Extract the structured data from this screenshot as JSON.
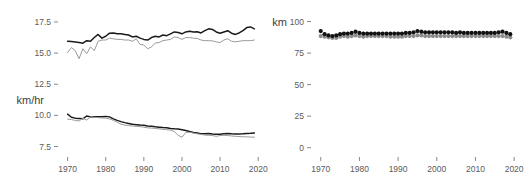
{
  "figure": {
    "background": "#ffffff",
    "text_color": "#4a4a4a"
  },
  "chart_data": [
    {
      "id": "speed-panel",
      "type": "line",
      "title": "",
      "xlabel": "",
      "ylabel": "km/hr",
      "ylabel_text": "km/hr",
      "xlim": [
        1968,
        2021
      ],
      "ylim": [
        6.9,
        18.3
      ],
      "yticks": [
        7.5,
        10.0,
        12.5,
        15.0,
        17.5
      ],
      "ytick_labels": [
        "7.5",
        "10.0",
        "12.5",
        "15.0",
        "17.5"
      ],
      "xticks": [
        1970,
        1980,
        1990,
        2000,
        2010,
        2020
      ],
      "xtick_labels": [
        "1970",
        "1980",
        "1990",
        "2000",
        "2010",
        "2020"
      ],
      "grid": false,
      "legend": "none",
      "x": [
        1970,
        1971,
        1972,
        1973,
        1974,
        1975,
        1976,
        1977,
        1978,
        1979,
        1980,
        1981,
        1982,
        1983,
        1984,
        1985,
        1986,
        1987,
        1988,
        1989,
        1990,
        1991,
        1992,
        1993,
        1994,
        1995,
        1996,
        1997,
        1998,
        1999,
        2000,
        2001,
        2002,
        2003,
        2004,
        2005,
        2006,
        2007,
        2008,
        2009,
        2010,
        2011,
        2012,
        2013,
        2014,
        2015,
        2016,
        2017,
        2018,
        2019
      ],
      "series": [
        {
          "name": "upper-black-speed",
          "color": "#1a1a1a",
          "width": 1.6,
          "values": [
            15.95,
            15.93,
            15.9,
            15.85,
            15.8,
            16.0,
            15.95,
            16.25,
            16.5,
            16.2,
            16.35,
            16.6,
            16.62,
            16.55,
            16.55,
            16.5,
            16.45,
            16.3,
            16.35,
            16.2,
            16.1,
            16.05,
            16.25,
            16.35,
            16.3,
            16.45,
            16.4,
            16.55,
            16.7,
            16.65,
            16.55,
            16.7,
            16.75,
            16.7,
            16.72,
            16.62,
            16.8,
            16.95,
            16.9,
            16.7,
            16.6,
            16.7,
            16.8,
            16.6,
            16.5,
            16.62,
            16.8,
            17.05,
            17.1,
            16.95
          ]
        },
        {
          "name": "lower-gray-speed",
          "color": "#9a9a9a",
          "width": 1.1,
          "values": [
            15.05,
            15.45,
            15.2,
            14.55,
            15.35,
            14.95,
            15.5,
            15.2,
            15.95,
            16.05,
            16.05,
            16.2,
            16.15,
            16.1,
            16.1,
            16.05,
            16.05,
            15.95,
            16.15,
            15.7,
            15.65,
            15.35,
            15.5,
            15.8,
            15.85,
            16.0,
            16.05,
            16.1,
            16.3,
            16.25,
            16.1,
            16.25,
            16.25,
            16.2,
            16.18,
            16.05,
            16.0,
            16.0,
            15.98,
            15.9,
            15.85,
            16.05,
            16.15,
            15.95,
            15.9,
            15.95,
            16.0,
            16.0,
            16.0,
            16.05
          ]
        },
        {
          "name": "lower-panel-black-speed",
          "color": "#1a1a1a",
          "width": 1.6,
          "values": [
            10.1,
            9.85,
            9.78,
            9.75,
            9.72,
            9.95,
            9.88,
            9.9,
            9.9,
            9.9,
            9.92,
            9.88,
            9.72,
            9.6,
            9.5,
            9.42,
            9.35,
            9.28,
            9.25,
            9.22,
            9.2,
            9.15,
            9.12,
            9.08,
            9.05,
            9.02,
            9.0,
            8.95,
            8.92,
            8.9,
            8.85,
            8.78,
            8.7,
            8.62,
            8.58,
            8.52,
            8.52,
            8.55,
            8.5,
            8.48,
            8.48,
            8.52,
            8.55,
            8.52,
            8.5,
            8.5,
            8.52,
            8.55,
            8.56,
            8.58
          ]
        },
        {
          "name": "lower-panel-gray-speed",
          "color": "#9a9a9a",
          "width": 1.1,
          "values": [
            9.7,
            9.66,
            9.6,
            9.55,
            9.78,
            9.62,
            9.88,
            9.85,
            9.82,
            9.8,
            9.78,
            9.72,
            9.6,
            9.45,
            9.3,
            9.22,
            9.18,
            9.15,
            9.12,
            9.1,
            9.05,
            9.0,
            8.98,
            8.95,
            8.92,
            8.88,
            8.85,
            8.82,
            8.7,
            8.4,
            8.25,
            8.62,
            8.65,
            8.58,
            8.52,
            8.48,
            8.42,
            8.4,
            8.38,
            8.32,
            8.38,
            8.4,
            8.38,
            8.35,
            8.32,
            8.3,
            8.28,
            8.28,
            8.26,
            8.25
          ]
        }
      ]
    },
    {
      "id": "distance-panel",
      "type": "scatter",
      "title": "",
      "xlabel": "",
      "ylabel": "km",
      "ylabel_text": "km",
      "xlim": [
        1968,
        2021
      ],
      "ylim": [
        -5,
        106
      ],
      "yticks": [
        0,
        25,
        50,
        75,
        100
      ],
      "ytick_labels": [
        "0",
        "25",
        "50",
        "75",
        "100"
      ],
      "xticks": [
        1970,
        1980,
        1990,
        2000,
        2010,
        2020
      ],
      "xtick_labels": [
        "1970",
        "1980",
        "1990",
        "2000",
        "2010",
        "2020"
      ],
      "grid": false,
      "legend": "none",
      "x": [
        1970,
        1971,
        1972,
        1973,
        1974,
        1975,
        1976,
        1977,
        1978,
        1979,
        1980,
        1981,
        1982,
        1983,
        1984,
        1985,
        1986,
        1987,
        1988,
        1989,
        1990,
        1991,
        1992,
        1993,
        1994,
        1995,
        1996,
        1997,
        1998,
        1999,
        2000,
        2001,
        2002,
        2003,
        2004,
        2005,
        2006,
        2007,
        2008,
        2009,
        2010,
        2011,
        2012,
        2013,
        2014,
        2015,
        2016,
        2017,
        2018,
        2019
      ],
      "series": [
        {
          "name": "black-distance",
          "color": "#111111",
          "marker": "circle",
          "size": 4.2,
          "values": [
            92.5,
            90.0,
            89.0,
            88.5,
            89.0,
            90.0,
            90.5,
            90.5,
            91.0,
            92.0,
            91.0,
            90.5,
            90.5,
            90.5,
            90.5,
            90.5,
            90.5,
            90.5,
            90.5,
            90.5,
            90.5,
            90.5,
            91.0,
            91.0,
            91.5,
            92.5,
            92.0,
            91.5,
            91.5,
            91.5,
            91.5,
            91.5,
            91.5,
            91.5,
            91.5,
            91.0,
            91.5,
            91.0,
            91.0,
            91.0,
            91.0,
            91.0,
            91.0,
            91.0,
            91.0,
            91.0,
            91.5,
            92.0,
            91.0,
            90.0
          ]
        },
        {
          "name": "gray-distance",
          "color": "#8c8c8c",
          "marker": "circle",
          "size": 4.2,
          "values": [
            88.5,
            88.0,
            87.5,
            87.0,
            87.0,
            88.0,
            88.5,
            88.0,
            88.5,
            89.0,
            88.5,
            88.0,
            88.5,
            88.5,
            88.5,
            88.5,
            88.5,
            88.5,
            88.0,
            88.0,
            88.0,
            88.0,
            88.5,
            88.5,
            88.5,
            89.0,
            89.0,
            88.5,
            88.5,
            88.5,
            88.5,
            88.5,
            88.5,
            88.5,
            88.5,
            88.5,
            88.5,
            88.5,
            88.5,
            88.5,
            88.5,
            88.5,
            88.5,
            88.5,
            88.5,
            88.5,
            88.5,
            88.5,
            88.0,
            87.5
          ]
        }
      ]
    }
  ]
}
